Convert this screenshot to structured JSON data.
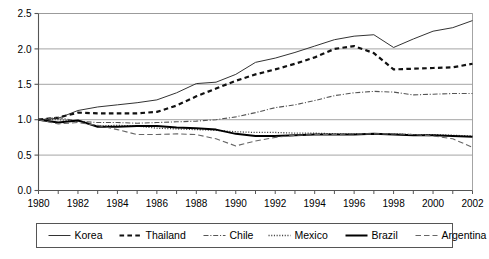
{
  "chart_data": {
    "type": "line",
    "title": "",
    "xlabel": "",
    "ylabel": "",
    "xlim": [
      1980,
      2002
    ],
    "ylim": [
      0.0,
      2.5
    ],
    "grid": true,
    "grid_axis": "y",
    "legend_position": "bottom",
    "yticks": [
      "0.0",
      "0.5",
      "1.0",
      "1.5",
      "2.0",
      "2.5"
    ],
    "ytick_values": [
      0.0,
      0.5,
      1.0,
      1.5,
      2.0,
      2.5
    ],
    "xticks": [
      "1980",
      "1982",
      "1984",
      "1986",
      "1988",
      "1990",
      "1992",
      "1994",
      "1996",
      "1998",
      "2000",
      "2002"
    ],
    "xtick_values": [
      1980,
      1982,
      1984,
      1986,
      1988,
      1990,
      1992,
      1994,
      1996,
      1998,
      2000,
      2002
    ],
    "minor_xticks_every": 1,
    "x": [
      1980,
      1981,
      1982,
      1983,
      1984,
      1985,
      1986,
      1987,
      1988,
      1989,
      1990,
      1991,
      1992,
      1993,
      1994,
      1995,
      1996,
      1997,
      1998,
      1999,
      2000,
      2001,
      2002
    ],
    "series": [
      {
        "name": "Korea",
        "style": "solid",
        "color": "#333333",
        "width": 1.0,
        "values": [
          1.0,
          1.02,
          1.13,
          1.18,
          1.21,
          1.24,
          1.28,
          1.38,
          1.51,
          1.53,
          1.64,
          1.81,
          1.87,
          1.95,
          2.04,
          2.13,
          2.18,
          2.2,
          2.02,
          2.14,
          2.25,
          2.3,
          2.4
        ]
      },
      {
        "name": "Thailand",
        "style": "dashed",
        "color": "#111111",
        "width": 2.2,
        "values": [
          1.0,
          1.03,
          1.1,
          1.09,
          1.09,
          1.09,
          1.11,
          1.2,
          1.33,
          1.44,
          1.55,
          1.64,
          1.71,
          1.79,
          1.88,
          2.0,
          2.04,
          1.94,
          1.71,
          1.72,
          1.73,
          1.74,
          1.79
        ]
      },
      {
        "name": "Chile",
        "style": "dashdot",
        "color": "#555555",
        "width": 1.1,
        "values": [
          1.0,
          1.03,
          0.98,
          0.96,
          0.96,
          0.95,
          0.96,
          0.97,
          0.98,
          1.0,
          1.04,
          1.1,
          1.17,
          1.21,
          1.27,
          1.34,
          1.38,
          1.4,
          1.39,
          1.35,
          1.36,
          1.37,
          1.37
        ]
      },
      {
        "name": "Mexico",
        "style": "dotted",
        "color": "#444444",
        "width": 1.3,
        "values": [
          1.0,
          1.0,
          0.98,
          0.91,
          0.92,
          0.91,
          0.88,
          0.87,
          0.86,
          0.85,
          0.83,
          0.82,
          0.82,
          0.81,
          0.81,
          0.8,
          0.8,
          0.8,
          0.8,
          0.79,
          0.79,
          0.78,
          0.77
        ]
      },
      {
        "name": "Brazil",
        "style": "solid",
        "color": "#000000",
        "width": 2.0,
        "values": [
          1.0,
          0.96,
          0.99,
          0.9,
          0.9,
          0.91,
          0.91,
          0.89,
          0.88,
          0.86,
          0.8,
          0.77,
          0.77,
          0.78,
          0.79,
          0.79,
          0.79,
          0.8,
          0.79,
          0.78,
          0.78,
          0.77,
          0.76
        ]
      },
      {
        "name": "Argentina",
        "style": "longdash",
        "color": "#666666",
        "width": 1.1,
        "values": [
          1.0,
          0.94,
          0.96,
          0.92,
          0.86,
          0.79,
          0.79,
          0.8,
          0.79,
          0.73,
          0.63,
          0.7,
          0.75,
          0.78,
          0.79,
          0.79,
          0.8,
          0.8,
          0.8,
          0.79,
          0.77,
          0.73,
          0.61
        ]
      }
    ]
  },
  "legend": {
    "items": [
      {
        "label": "Korea"
      },
      {
        "label": "Thailand"
      },
      {
        "label": "Chile"
      },
      {
        "label": "Mexico"
      },
      {
        "label": "Brazil"
      },
      {
        "label": "Argentina"
      }
    ]
  }
}
